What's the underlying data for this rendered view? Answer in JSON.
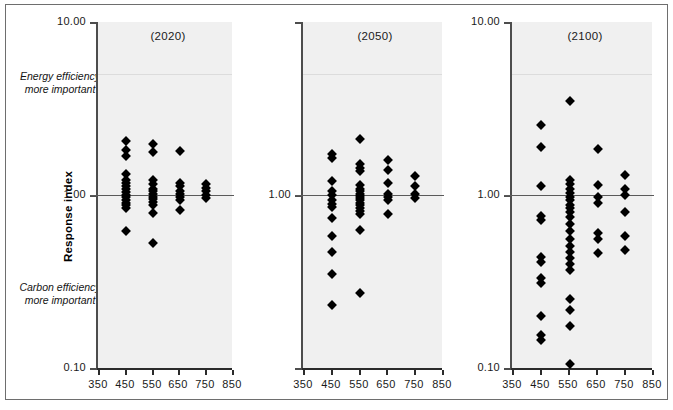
{
  "figure": {
    "background_color": "#ffffff",
    "frame_color": "#6e6e6e",
    "plot_fill_color": "#f0f0f0",
    "marker_color": "#000000",
    "reference_line_color": "#5a5a5a"
  },
  "axes": {
    "y_title": "Response index",
    "y_ticks": [
      "10.00",
      "1.00",
      "0.10"
    ],
    "y_tick_values": [
      10.0,
      1.0,
      0.1
    ],
    "y_scale": "log",
    "y_min": 0.1,
    "y_max": 10.0,
    "x_ticks": [
      "350",
      "450",
      "550",
      "650",
      "750",
      "850"
    ],
    "x_tick_values": [
      350,
      450,
      550,
      650,
      750,
      850
    ],
    "x_min": 350,
    "x_max": 850,
    "x_label": ""
  },
  "annotations": {
    "top": "Energy efficiency\nmore important",
    "top_line1": "Energy efficiency",
    "top_line2": "more important",
    "bottom_line1": "Carbon efficiency",
    "bottom_line2": "more important",
    "reference_value": "1.00"
  },
  "chart_data": {
    "type": "scatter",
    "title": "",
    "xlabel": "",
    "ylabel": "Response index",
    "yscale": "log",
    "ylim": [
      0.1,
      10.0
    ],
    "xlim": [
      350,
      850
    ],
    "grid": false,
    "legend": "none",
    "panels": [
      {
        "label": "(2020)",
        "points": [
          {
            "x": 455,
            "y": 2.05
          },
          {
            "x": 455,
            "y": 1.82
          },
          {
            "x": 455,
            "y": 1.68
          },
          {
            "x": 455,
            "y": 1.32
          },
          {
            "x": 455,
            "y": 1.22
          },
          {
            "x": 455,
            "y": 1.17
          },
          {
            "x": 455,
            "y": 1.12
          },
          {
            "x": 455,
            "y": 1.08
          },
          {
            "x": 455,
            "y": 1.04
          },
          {
            "x": 455,
            "y": 1.0
          },
          {
            "x": 455,
            "y": 0.97
          },
          {
            "x": 455,
            "y": 0.94
          },
          {
            "x": 455,
            "y": 0.9
          },
          {
            "x": 455,
            "y": 0.87
          },
          {
            "x": 455,
            "y": 0.84
          },
          {
            "x": 455,
            "y": 0.62
          },
          {
            "x": 556,
            "y": 1.98
          },
          {
            "x": 556,
            "y": 1.78
          },
          {
            "x": 556,
            "y": 1.22
          },
          {
            "x": 556,
            "y": 1.15
          },
          {
            "x": 556,
            "y": 1.09
          },
          {
            "x": 556,
            "y": 1.05
          },
          {
            "x": 556,
            "y": 1.01
          },
          {
            "x": 556,
            "y": 0.98
          },
          {
            "x": 556,
            "y": 0.95
          },
          {
            "x": 556,
            "y": 0.91
          },
          {
            "x": 556,
            "y": 0.87
          },
          {
            "x": 556,
            "y": 0.79
          },
          {
            "x": 556,
            "y": 0.53
          },
          {
            "x": 657,
            "y": 1.8
          },
          {
            "x": 657,
            "y": 1.18
          },
          {
            "x": 657,
            "y": 1.12
          },
          {
            "x": 657,
            "y": 1.06
          },
          {
            "x": 657,
            "y": 1.02
          },
          {
            "x": 657,
            "y": 0.98
          },
          {
            "x": 657,
            "y": 0.94
          },
          {
            "x": 657,
            "y": 0.82
          },
          {
            "x": 753,
            "y": 1.16
          },
          {
            "x": 753,
            "y": 1.1
          },
          {
            "x": 753,
            "y": 1.05
          },
          {
            "x": 753,
            "y": 1.0
          },
          {
            "x": 753,
            "y": 0.96
          }
        ]
      },
      {
        "label": "(2050)",
        "points": [
          {
            "x": 455,
            "y": 1.72
          },
          {
            "x": 455,
            "y": 1.63
          },
          {
            "x": 455,
            "y": 1.2
          },
          {
            "x": 455,
            "y": 1.06
          },
          {
            "x": 455,
            "y": 1.0
          },
          {
            "x": 455,
            "y": 0.94
          },
          {
            "x": 455,
            "y": 0.89
          },
          {
            "x": 455,
            "y": 0.85
          },
          {
            "x": 455,
            "y": 0.74
          },
          {
            "x": 455,
            "y": 0.58
          },
          {
            "x": 455,
            "y": 0.47
          },
          {
            "x": 455,
            "y": 0.35
          },
          {
            "x": 455,
            "y": 0.23
          },
          {
            "x": 556,
            "y": 2.1
          },
          {
            "x": 556,
            "y": 1.52
          },
          {
            "x": 556,
            "y": 1.44
          },
          {
            "x": 556,
            "y": 1.38
          },
          {
            "x": 556,
            "y": 1.14
          },
          {
            "x": 556,
            "y": 1.09
          },
          {
            "x": 556,
            "y": 1.05
          },
          {
            "x": 556,
            "y": 1.02
          },
          {
            "x": 556,
            "y": 0.99
          },
          {
            "x": 556,
            "y": 0.96
          },
          {
            "x": 556,
            "y": 0.93
          },
          {
            "x": 556,
            "y": 0.9
          },
          {
            "x": 556,
            "y": 0.87
          },
          {
            "x": 556,
            "y": 0.84
          },
          {
            "x": 556,
            "y": 0.81
          },
          {
            "x": 556,
            "y": 0.78
          },
          {
            "x": 556,
            "y": 0.63
          },
          {
            "x": 556,
            "y": 0.27
          },
          {
            "x": 657,
            "y": 1.6
          },
          {
            "x": 657,
            "y": 1.4
          },
          {
            "x": 657,
            "y": 1.18
          },
          {
            "x": 657,
            "y": 1.02
          },
          {
            "x": 657,
            "y": 0.97
          },
          {
            "x": 657,
            "y": 0.93
          },
          {
            "x": 657,
            "y": 0.78
          },
          {
            "x": 753,
            "y": 1.28
          },
          {
            "x": 753,
            "y": 1.13
          },
          {
            "x": 753,
            "y": 1.01
          },
          {
            "x": 753,
            "y": 0.96
          }
        ]
      },
      {
        "label": "(2100)",
        "points": [
          {
            "x": 455,
            "y": 2.55
          },
          {
            "x": 455,
            "y": 1.9
          },
          {
            "x": 455,
            "y": 1.12
          },
          {
            "x": 455,
            "y": 0.76
          },
          {
            "x": 455,
            "y": 0.72
          },
          {
            "x": 455,
            "y": 0.44
          },
          {
            "x": 455,
            "y": 0.41
          },
          {
            "x": 455,
            "y": 0.33
          },
          {
            "x": 455,
            "y": 0.31
          },
          {
            "x": 455,
            "y": 0.2
          },
          {
            "x": 455,
            "y": 0.155
          },
          {
            "x": 455,
            "y": 0.145
          },
          {
            "x": 556,
            "y": 3.5
          },
          {
            "x": 556,
            "y": 1.22
          },
          {
            "x": 556,
            "y": 1.15
          },
          {
            "x": 556,
            "y": 1.09
          },
          {
            "x": 556,
            "y": 1.03
          },
          {
            "x": 556,
            "y": 0.98
          },
          {
            "x": 556,
            "y": 0.93
          },
          {
            "x": 556,
            "y": 0.88
          },
          {
            "x": 556,
            "y": 0.84
          },
          {
            "x": 556,
            "y": 0.8
          },
          {
            "x": 556,
            "y": 0.75
          },
          {
            "x": 556,
            "y": 0.68
          },
          {
            "x": 556,
            "y": 0.62
          },
          {
            "x": 556,
            "y": 0.56
          },
          {
            "x": 556,
            "y": 0.51
          },
          {
            "x": 556,
            "y": 0.47
          },
          {
            "x": 556,
            "y": 0.43
          },
          {
            "x": 556,
            "y": 0.4
          },
          {
            "x": 556,
            "y": 0.37
          },
          {
            "x": 556,
            "y": 0.25
          },
          {
            "x": 556,
            "y": 0.215
          },
          {
            "x": 556,
            "y": 0.175
          },
          {
            "x": 556,
            "y": 0.105
          },
          {
            "x": 657,
            "y": 1.85
          },
          {
            "x": 657,
            "y": 1.14
          },
          {
            "x": 657,
            "y": 0.98
          },
          {
            "x": 657,
            "y": 0.9
          },
          {
            "x": 657,
            "y": 0.6
          },
          {
            "x": 657,
            "y": 0.56
          },
          {
            "x": 657,
            "y": 0.46
          },
          {
            "x": 753,
            "y": 1.3
          },
          {
            "x": 753,
            "y": 1.08
          },
          {
            "x": 753,
            "y": 1.0
          },
          {
            "x": 753,
            "y": 0.8
          },
          {
            "x": 753,
            "y": 0.58
          },
          {
            "x": 753,
            "y": 0.48
          }
        ]
      }
    ]
  },
  "layout": {
    "panel_geometry": [
      {
        "plot_left": 98,
        "plot_right": 232,
        "plot_top": 22,
        "plot_bottom": 368,
        "title_center": 168
      },
      {
        "plot_left": 303,
        "plot_right": 442,
        "plot_top": 22,
        "plot_bottom": 368,
        "title_center": 375
      },
      {
        "plot_left": 512,
        "plot_right": 652,
        "plot_top": 22,
        "plot_bottom": 368,
        "title_center": 585
      }
    ]
  }
}
